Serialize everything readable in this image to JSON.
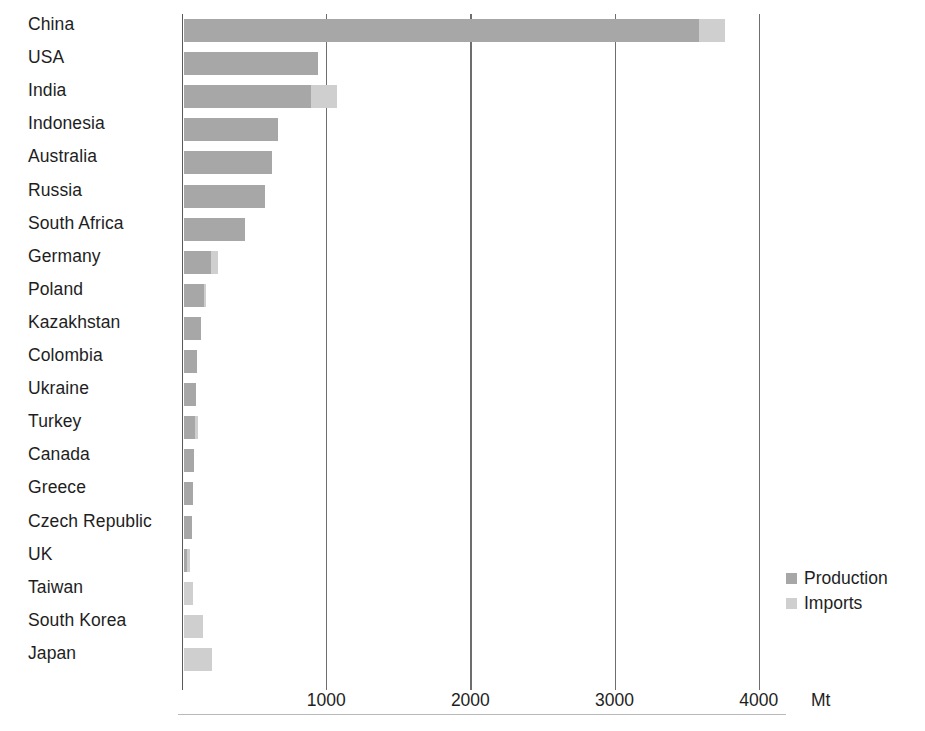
{
  "chart_data": {
    "type": "bar",
    "orientation": "horizontal",
    "stacked": true,
    "title": "",
    "xlabel": "Mt",
    "ylabel": "",
    "xlim": [
      0,
      4300
    ],
    "xticks": [
      1000,
      2000,
      3000,
      4000
    ],
    "xtick_labels": [
      "1000",
      "2000",
      "3000",
      "4000"
    ],
    "unit": "Mt",
    "grid": "vertical",
    "legend_position": "right",
    "categories": [
      "China",
      "USA",
      "India",
      "Indonesia",
      "Australia",
      "Russia",
      "South Africa",
      "Germany",
      "Poland",
      "Kazakhstan",
      "Colombia",
      "Ukraine",
      "Turkey",
      "Canada",
      "Greece",
      "Czech Republic",
      "UK",
      "Taiwan",
      "South Korea",
      "Japan"
    ],
    "series": [
      {
        "name": "Production",
        "color": "#a7a7a7",
        "values": [
          3570,
          930,
          880,
          650,
          610,
          560,
          420,
          190,
          140,
          120,
          90,
          85,
          75,
          70,
          62,
          58,
          18,
          0,
          2,
          1
        ]
      },
      {
        "name": "Imports",
        "color": "#cfcfcf",
        "values": [
          180,
          0,
          180,
          0,
          0,
          0,
          0,
          45,
          10,
          0,
          0,
          0,
          25,
          0,
          0,
          0,
          25,
          65,
          130,
          190
        ]
      }
    ],
    "legend": [
      {
        "label": "Production",
        "color": "#a7a7a7"
      },
      {
        "label": "Imports",
        "color": "#cfcfcf"
      }
    ],
    "axis_color": "#595959",
    "gridline_color": "#6e6e6e",
    "background": "#ffffff"
  }
}
